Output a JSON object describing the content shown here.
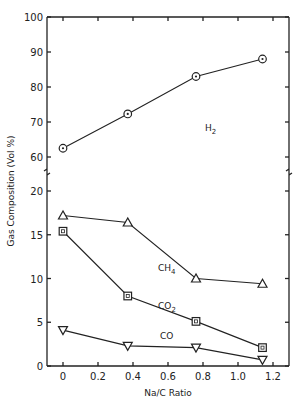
{
  "chart_data": {
    "type": "line",
    "title": "",
    "xlabel": "Na/C Ratio",
    "ylabel": "Gas Composition (Vol %)",
    "xlim": [
      -0.1,
      1.3
    ],
    "x_ticks": [
      "0",
      "0.2",
      "0.4",
      "0.6",
      "0.8",
      "1.0",
      "1.2"
    ],
    "y_axis_broken": true,
    "y_ticks_lower": [
      "0",
      "5",
      "10",
      "15",
      "20"
    ],
    "y_ticks_upper": [
      "60",
      "70",
      "80",
      "90",
      "100"
    ],
    "ylim_lower": [
      0,
      22
    ],
    "ylim_upper": [
      57,
      100
    ],
    "grid": false,
    "legend": "inline labels",
    "x": [
      0,
      0.37,
      0.76,
      1.14
    ],
    "series": [
      {
        "name": "H2",
        "label": "H",
        "sub": "2",
        "marker": "circle",
        "values": [
          62.5,
          72.3,
          83,
          88
        ]
      },
      {
        "name": "CH4",
        "label": "CH",
        "sub": "4",
        "marker": "triangle-up",
        "values": [
          17.2,
          16.4,
          10,
          9.4
        ]
      },
      {
        "name": "CO2",
        "label": "CO",
        "sub": "2",
        "marker": "square",
        "values": [
          15.4,
          8.0,
          5.1,
          2.1
        ]
      },
      {
        "name": "CO",
        "label": "CO",
        "sub": "",
        "marker": "triangle-down",
        "values": [
          4.1,
          2.3,
          2.1,
          0.7
        ]
      }
    ]
  }
}
